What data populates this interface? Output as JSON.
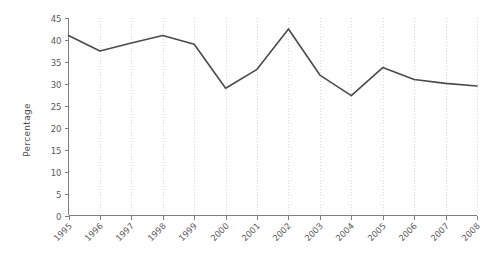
{
  "chart_data": {
    "type": "line",
    "title": "",
    "subtitle": "",
    "xlabel": "",
    "ylabel": "Percentage",
    "categories": [
      "1995",
      "1996",
      "1997",
      "1998",
      "1999",
      "2000",
      "2001",
      "2002",
      "2003",
      "2004",
      "2005",
      "2006",
      "2007",
      "2008"
    ],
    "values": [
      41,
      37.5,
      39.3,
      41,
      39,
      29,
      33.3,
      42.5,
      32,
      27.3,
      33.7,
      31,
      30.1,
      29.5
    ],
    "series": [
      {
        "name": "Percentage",
        "color": "#4a4a4a",
        "values": [
          41,
          37.5,
          39.3,
          41,
          39,
          29,
          33.3,
          42.5,
          32,
          27.3,
          33.7,
          31,
          30.1,
          29.5
        ]
      }
    ],
    "ylim": [
      0,
      45
    ],
    "yticks": [
      0,
      5,
      10,
      15,
      20,
      25,
      30,
      35,
      40,
      45
    ],
    "ytick_labels": [
      "0",
      "5",
      "10",
      "15",
      "20",
      "25",
      "30",
      "35",
      "40",
      "45"
    ],
    "xtick_labels": [
      "1995",
      "1996",
      "1997",
      "1998",
      "1999",
      "2000",
      "2001",
      "2002",
      "2003",
      "2004",
      "2005",
      "2006",
      "2007",
      "2008"
    ],
    "xtick_rotation": -45,
    "grid": {
      "vertical": true,
      "horizontal": false,
      "style": "dotted",
      "color": "#d8d8d8"
    },
    "legend": {
      "visible": false,
      "position": "none"
    },
    "axis_color": "#7d7d7d",
    "background_color": "#ffffff"
  }
}
